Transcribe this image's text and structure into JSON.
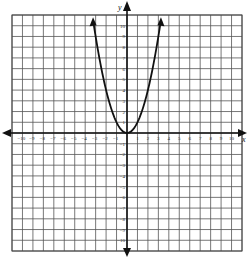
{
  "chart_data": {
    "type": "line",
    "title": "",
    "function": "y = x^2",
    "xlabel": "x",
    "ylabel": "y",
    "xlim": [
      -11,
      11
    ],
    "ylim": [
      -11,
      11
    ],
    "grid": true,
    "x_tick_labels": [
      "-10",
      "-9",
      "-8",
      "-7",
      "-6",
      "-5",
      "-4",
      "-3",
      "-2",
      "-1",
      "1",
      "2",
      "3",
      "4",
      "5",
      "6",
      "7",
      "8",
      "9",
      "10"
    ],
    "y_tick_labels": [
      "10",
      "9",
      "8",
      "7",
      "6",
      "5",
      "4",
      "3",
      "2",
      "1",
      "-1",
      "-2",
      "-3",
      "-4",
      "-5",
      "-6",
      "-7",
      "-8",
      "-9",
      "-10"
    ],
    "series": [
      {
        "name": "parabola",
        "x": [
          -3.2,
          -3,
          -2.5,
          -2,
          -1.5,
          -1,
          -0.5,
          0,
          0.5,
          1,
          1.5,
          2,
          2.5,
          3,
          3.2
        ],
        "y": [
          10.24,
          9,
          6.25,
          4,
          2.25,
          1,
          0.25,
          0,
          0.25,
          1,
          2.25,
          4,
          6.25,
          9,
          10.24
        ],
        "arrows": "both-ends"
      }
    ]
  },
  "labels": {
    "x_axis": "x",
    "y_axis": "y"
  }
}
